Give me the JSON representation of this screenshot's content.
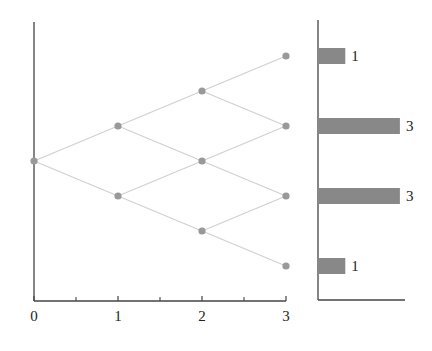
{
  "chart_data": {
    "type": "diagram",
    "title": "",
    "lattice": {
      "x_ticks": [
        "0",
        "1",
        "2",
        "3"
      ],
      "x_minor_ticks": [
        0.5,
        1.5,
        2.5
      ],
      "nodes": [
        {
          "step": 0,
          "level": 0
        },
        {
          "step": 1,
          "level": 1
        },
        {
          "step": 1,
          "level": -1
        },
        {
          "step": 2,
          "level": 2
        },
        {
          "step": 2,
          "level": 0
        },
        {
          "step": 2,
          "level": -2
        },
        {
          "step": 3,
          "level": 3
        },
        {
          "step": 3,
          "level": 1
        },
        {
          "step": 3,
          "level": -1
        },
        {
          "step": 3,
          "level": -3
        }
      ],
      "node_color": "#999999",
      "edge_color": "#d0d0d0"
    },
    "histogram": {
      "type": "bar",
      "orientation": "horizontal",
      "categories": [
        "3",
        "1",
        "-1",
        "-3"
      ],
      "values": [
        1,
        3,
        3,
        1
      ],
      "labels": [
        "1",
        "3",
        "3",
        "1"
      ],
      "bar_color": "#888888"
    }
  }
}
